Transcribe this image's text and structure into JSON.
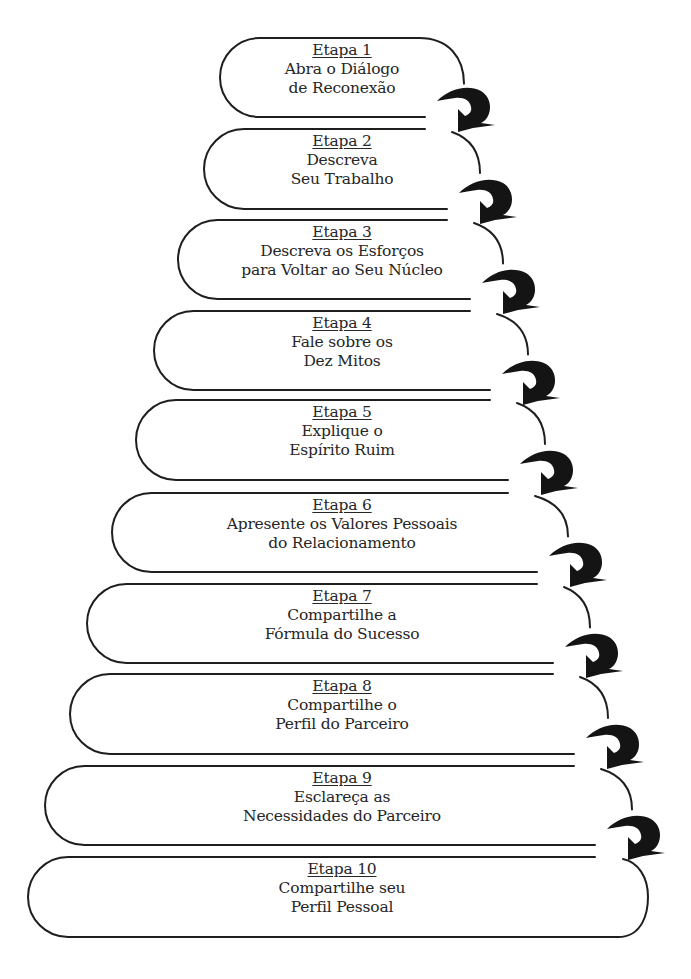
{
  "diagram": {
    "type": "stepped-staircase-flow",
    "colors": {
      "stroke": "#1e1e1e",
      "arrow": "#141414",
      "text": "#262626",
      "background": "#ffffff"
    },
    "connector_icon": "curved-hook-arrow",
    "steps": [
      {
        "title": "Etapa 1",
        "lines": [
          "Abra o Diálogo",
          "de Reconexão"
        ]
      },
      {
        "title": "Etapa 2",
        "lines": [
          "Descreva",
          "Seu Trabalho"
        ]
      },
      {
        "title": "Etapa 3",
        "lines": [
          "Descreva os Esforços",
          "para Voltar ao Seu Núcleo"
        ]
      },
      {
        "title": "Etapa 4",
        "lines": [
          "Fale sobre os",
          "Dez Mitos"
        ]
      },
      {
        "title": "Etapa 5",
        "lines": [
          "Explique o",
          "Espírito Ruim"
        ]
      },
      {
        "title": "Etapa 6",
        "lines": [
          "Apresente os Valores Pessoais",
          "do Relacionamento"
        ]
      },
      {
        "title": "Etapa 7",
        "lines": [
          "Compartilhe a",
          "Fórmula do Sucesso"
        ]
      },
      {
        "title": "Etapa 8",
        "lines": [
          "Compartilhe o",
          "Perfil do Parceiro"
        ]
      },
      {
        "title": "Etapa 9",
        "lines": [
          "Esclareça as",
          "Necessidades do Parceiro"
        ]
      },
      {
        "title": "Etapa 10",
        "lines": [
          "Compartilhe seu",
          "Perfil Pessoal"
        ]
      }
    ]
  }
}
